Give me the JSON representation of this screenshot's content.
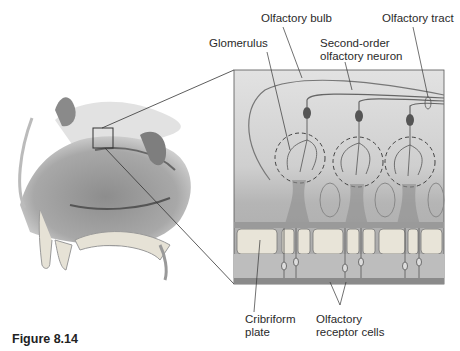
{
  "figure": {
    "caption": "Figure 8.14",
    "labels": {
      "olfactory_bulb": "Olfactory bulb",
      "olfactory_tract": "Olfactory tract",
      "glomerulus": "Glomerulus",
      "second_order_line1": "Second-order",
      "second_order_line2": "olfactory neuron",
      "cribriform_line1": "Cribriform",
      "cribriform_line2": "plate",
      "receptor_line1": "Olfactory",
      "receptor_line2": "receptor cells"
    }
  },
  "colors": {
    "ink": "#2a2a2a",
    "panel_bg": "#d6d6d6",
    "bone": "#e8e4d8",
    "tissue": "#9a9a9a"
  }
}
